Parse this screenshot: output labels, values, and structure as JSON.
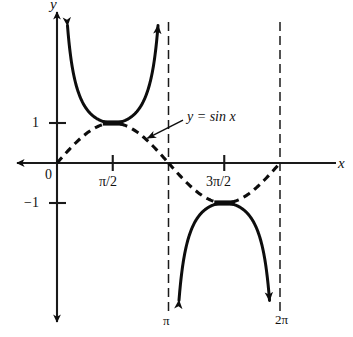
{
  "figure": {
    "name": "cosecant-and-sine-graph",
    "background_color": "#ffffff",
    "ink_color": "#0d0d0d"
  },
  "axes": {
    "x_axis_label": "x",
    "y_axis_label": "y",
    "origin_label": "0"
  },
  "labels": {
    "curve_annotation": "y = sin x",
    "curve_annotation_lhs": "y",
    "curve_annotation_eq": " = sin ",
    "curve_annotation_var": "x"
  },
  "ticks": {
    "y": [
      {
        "value": 1,
        "label": "1"
      },
      {
        "value": -1,
        "label": "−1"
      }
    ],
    "x": [
      {
        "value": 1.5707963,
        "label": "π/2",
        "position": "below-axis"
      },
      {
        "value": 4.712389,
        "label": "3π/2",
        "position": "below-axis"
      }
    ]
  },
  "asymptote_labels": [
    {
      "value": 3.1415927,
      "label": "π"
    },
    {
      "value": 6.2831853,
      "label": "2π"
    }
  ],
  "chart_data": {
    "type": "line",
    "title": "",
    "xlabel": "x",
    "ylabel": "y",
    "xlim": [
      -0.55,
      7.1
    ],
    "ylim": [
      -3.45,
      3.45
    ],
    "grid": false,
    "legend": "inline-annotation",
    "x_tick_labels": [
      "0",
      "π/2",
      "π",
      "3π/2",
      "2π"
    ],
    "x_tick_values": [
      0,
      1.5707963,
      3.1415927,
      4.712389,
      6.2831853
    ],
    "y_tick_labels": [
      "1",
      "−1"
    ],
    "y_tick_values": [
      1,
      -1
    ],
    "series": [
      {
        "name": "y = sin x",
        "style": "dashed",
        "label_shown": "y = sin x",
        "domain": [
          0,
          6.2831853
        ],
        "expression": "sin(x)",
        "key_points": [
          {
            "x": 0,
            "y": 0
          },
          {
            "x": 1.5707963,
            "y": 1
          },
          {
            "x": 3.1415927,
            "y": 0
          },
          {
            "x": 4.712389,
            "y": -1
          },
          {
            "x": 6.2831853,
            "y": 0
          }
        ]
      },
      {
        "name": "y = csc x",
        "style": "solid",
        "label_shown": "",
        "expression": "1/sin(x)",
        "branches": [
          {
            "domain": [
              0,
              3.1415927
            ],
            "vertex": {
              "x": 1.5707963,
              "y": 1
            },
            "direction": "up"
          },
          {
            "domain": [
              3.1415927,
              6.2831853
            ],
            "vertex": {
              "x": 4.712389,
              "y": -1
            },
            "direction": "down"
          }
        ]
      }
    ],
    "asymptotes": [
      {
        "x": 3.1415927,
        "label": "π",
        "style": "dashed"
      },
      {
        "x": 6.2831853,
        "label": "2π",
        "style": "dashed"
      }
    ],
    "annotations": [
      {
        "text": "y = sin x",
        "points_to": {
          "x": 2.55,
          "y": 0.62
        },
        "text_anchor": {
          "x": 3.55,
          "y": 1.07
        }
      }
    ]
  }
}
